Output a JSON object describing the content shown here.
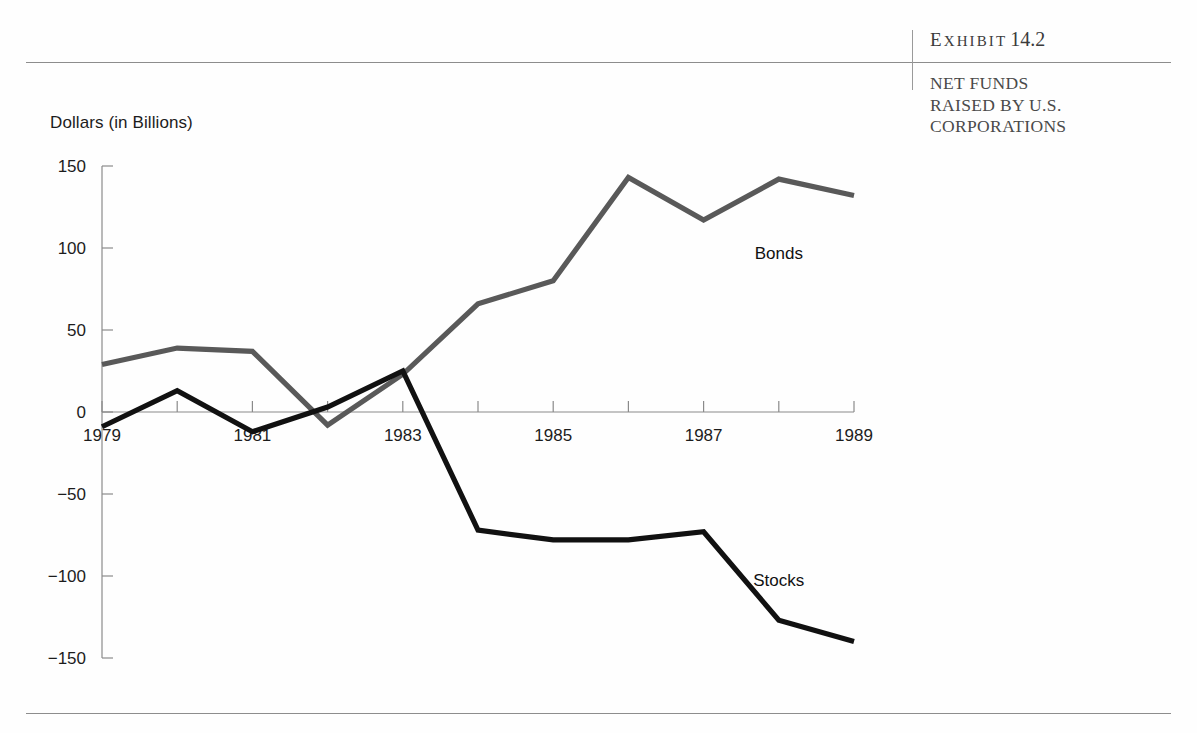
{
  "exhibit": {
    "label_prefix": "E",
    "label_rest": "XHIBIT",
    "number": "14.2",
    "subtitle": "NET FUNDS\nRAISED BY U.S.\nCORPORATIONS"
  },
  "chart_data": {
    "type": "line",
    "title": "",
    "xlabel": "",
    "ylabel": "Dollars (in Billions)",
    "x": [
      1979,
      1980,
      1981,
      1982,
      1983,
      1984,
      1985,
      1986,
      1987,
      1988,
      1989
    ],
    "xtick_labels": [
      "1979",
      "1981",
      "1983",
      "1985",
      "1987",
      "1989"
    ],
    "xtick_values": [
      1979,
      1981,
      1983,
      1985,
      1987,
      1989
    ],
    "xlim": [
      1979,
      1989
    ],
    "ytick_labels": [
      "150",
      "100",
      "50",
      "0",
      "−50",
      "−100",
      "−150"
    ],
    "ytick_values": [
      150,
      100,
      50,
      0,
      -50,
      -100,
      -150
    ],
    "ylim": [
      -150,
      150
    ],
    "grid": false,
    "legend_position": "inline-annotations",
    "series": [
      {
        "name": "Bonds",
        "color": "#595959",
        "values": [
          29,
          39,
          37,
          -8,
          23,
          66,
          80,
          143,
          117,
          142,
          132
        ],
        "label_x": 1988.0,
        "label_y": 93
      },
      {
        "name": "Stocks",
        "color": "#111111",
        "values": [
          -9,
          13,
          -12,
          3,
          25,
          -72,
          -78,
          -78,
          -73,
          -127,
          -140
        ],
        "label_x": 1988.0,
        "label_y": -106
      }
    ]
  }
}
